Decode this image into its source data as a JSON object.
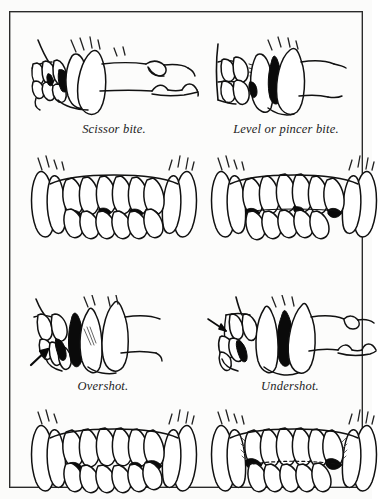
{
  "plate": {
    "background_color": "#fcfcfb",
    "border_color": "#2a2a2a",
    "ink_color": "#101010",
    "fill_color": "#ffffff",
    "shadow_color": "#000000",
    "title": "",
    "figure_count": 8,
    "caption_count": 4
  },
  "figures": [
    {
      "id": "scissor-side",
      "name": "scissor-bite-side-view",
      "view": "side",
      "bite_type": "Scissor bite",
      "has_arrow": false,
      "description": "Side view of canine jaw showing upper incisors overlapping lower incisors, canines interlocking, premolars behind."
    },
    {
      "id": "level-side",
      "name": "level-or-pincer-bite-side-view",
      "view": "side",
      "bite_type": "Level or pincer bite",
      "has_arrow": false,
      "description": "Side view showing upper and lower incisors meeting edge to edge."
    },
    {
      "id": "scissor-front",
      "name": "scissor-bite-front-view",
      "view": "front",
      "bite_type": "Scissor bite",
      "has_arrow": false,
      "description": "Front view of full dentition, upper incisors closing just in front of lower incisors."
    },
    {
      "id": "level-front",
      "name": "level-or-pincer-bite-front-view",
      "view": "front",
      "bite_type": "Level or pincer bite",
      "has_arrow": false,
      "description": "Front view of full dentition with incisor edges meeting directly."
    },
    {
      "id": "overshot-side",
      "name": "overshot-bite-side-view",
      "view": "side",
      "bite_type": "Overshot",
      "has_arrow": true,
      "description": "Side view, arrow points to gap where upper jaw projects beyond lower."
    },
    {
      "id": "undershot-side",
      "name": "undershot-bite-side-view",
      "view": "side",
      "bite_type": "Undershot",
      "has_arrow": true,
      "description": "Side view, arrow points to lower jaw projecting beyond the upper."
    },
    {
      "id": "overshot-front",
      "name": "overshot-bite-front-view",
      "view": "front",
      "bite_type": "Overshot",
      "has_arrow": false,
      "description": "Front view of overshot dentition."
    },
    {
      "id": "undershot-front",
      "name": "undershot-bite-front-view",
      "view": "front",
      "bite_type": "Undershot",
      "has_arrow": false,
      "description": "Front view of undershot dentition with lower incisors ahead of upper."
    }
  ],
  "captions": {
    "scissor": "Scissor bite.",
    "level": "Level or pincer bite.",
    "overshot": "Overshot.",
    "undershot": "Undershot."
  }
}
